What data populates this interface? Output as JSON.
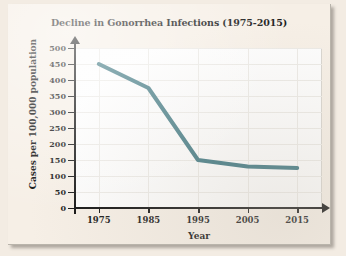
{
  "figure": {
    "title": "Decline in Gonorrhea Infections (1975-2015)",
    "line_color": "#3d7680",
    "plot_background": "#fdfdfd",
    "paper_background": "#f6efe6"
  },
  "chart_data": {
    "type": "line",
    "title": "Decline in Gonorrhea Infections (1975-2015)",
    "xlabel": "Year",
    "ylabel": "Cases per 100,000 population",
    "x": [
      1975,
      1985,
      1995,
      2005,
      2015
    ],
    "values": [
      450,
      375,
      150,
      130,
      125
    ],
    "series": [
      {
        "name": "Gonorrhea cases per 100,000 population",
        "values": [
          450,
          375,
          150,
          130,
          125
        ],
        "color": "#3d7680"
      }
    ],
    "xlim": [
      1970,
      2020
    ],
    "ylim": [
      0,
      500
    ],
    "ytick_labels": [
      "500",
      "450",
      "400",
      "350",
      "300",
      "250",
      "200",
      "150",
      "100",
      "50",
      "0"
    ],
    "ytick_values": [
      500,
      450,
      400,
      350,
      300,
      250,
      200,
      150,
      100,
      50,
      0
    ],
    "xtick_labels": [
      "1975",
      "1985",
      "1995",
      "2005",
      "2015"
    ],
    "xtick_values": [
      1975,
      1985,
      1995,
      2005,
      2015
    ],
    "grid": true,
    "legend": false,
    "markers": false
  }
}
